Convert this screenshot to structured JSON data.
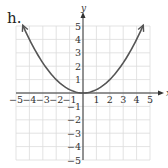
{
  "problem_label": "h.",
  "chart_data": {
    "type": "line",
    "title": "",
    "function": "y = x^2/4",
    "xlabel": "x",
    "ylabel": "y",
    "xlim": [
      -5,
      5
    ],
    "ylim": [
      -5,
      5
    ],
    "grid": true,
    "x_ticks": [
      "-5",
      "-4",
      "-3",
      "-2",
      "-1",
      "1",
      "2",
      "3",
      "4",
      "5"
    ],
    "y_ticks": [
      "5",
      "4",
      "3",
      "2",
      "1",
      "-1",
      "-2",
      "-3",
      "-4",
      "-5"
    ],
    "series": [
      {
        "name": "parabola",
        "x": [
          -4.5,
          -4,
          -3,
          -2,
          -1,
          0,
          1,
          2,
          3,
          4,
          4.5
        ],
        "y": [
          5.06,
          4,
          2.25,
          1,
          0.25,
          0,
          0.25,
          1,
          2.25,
          4,
          5.06
        ],
        "arrows_at_ends": true
      }
    ],
    "colors": {
      "grid": "#dcdcdc",
      "axes": "#333333",
      "curve": "#555555"
    }
  }
}
